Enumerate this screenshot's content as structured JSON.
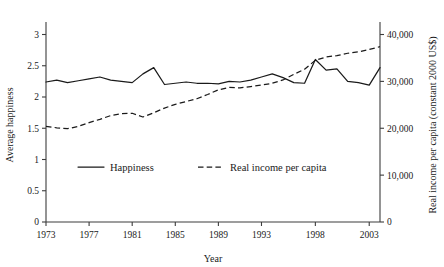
{
  "chart_data": {
    "type": "line",
    "title": "",
    "xlabel": "Year",
    "ylabel": "Average happiness",
    "y2label": "Real income per capita (constant 2000 US$)",
    "grid": false,
    "legend_position": "inside-bottom-center",
    "xlim": [
      1973,
      2004
    ],
    "ylim": [
      0,
      3.2
    ],
    "y2lim": [
      0,
      42667
    ],
    "xticks": [
      "1973",
      "1977",
      "1981",
      "1985",
      "1989",
      "1993",
      "1998",
      "2003"
    ],
    "xtick_values": [
      1973,
      1977,
      1981,
      1985,
      1989,
      1993,
      1998,
      2003
    ],
    "yticks": [
      "0",
      "0.5",
      "1",
      "1.5",
      "2",
      "2.5",
      "3"
    ],
    "ytick_values": [
      0,
      0.5,
      1,
      1.5,
      2,
      2.5,
      3
    ],
    "y2ticks": [
      "0",
      "10,000",
      "20,000",
      "30,000",
      "40,000"
    ],
    "y2tick_values": [
      0,
      10000,
      20000,
      30000,
      40000
    ],
    "x": [
      1973,
      1974,
      1975,
      1976,
      1977,
      1978,
      1979,
      1980,
      1981,
      1982,
      1983,
      1984,
      1985,
      1986,
      1987,
      1988,
      1989,
      1990,
      1991,
      1992,
      1993,
      1994,
      1995,
      1996,
      1997,
      1998,
      1999,
      2000,
      2001,
      2002,
      2003,
      2004
    ],
    "series": [
      {
        "name": "Happiness",
        "axis": "left",
        "style": "solid",
        "values": [
          2.24,
          2.27,
          2.23,
          2.26,
          2.29,
          2.32,
          2.27,
          2.25,
          2.23,
          2.37,
          2.47,
          2.2,
          2.22,
          2.24,
          2.22,
          2.22,
          2.21,
          2.25,
          2.24,
          2.27,
          2.32,
          2.37,
          2.31,
          2.23,
          2.22,
          2.6,
          2.43,
          2.45,
          2.25,
          2.23,
          2.19,
          2.47
        ]
      },
      {
        "name": "Real income per capita",
        "axis": "right",
        "style": "dashed",
        "values": [
          20400,
          20100,
          19900,
          20400,
          21200,
          21900,
          22700,
          23100,
          23200,
          22400,
          23300,
          24300,
          25100,
          25700,
          26300,
          27200,
          28200,
          28700,
          28600,
          28900,
          29200,
          29600,
          30300,
          31500,
          32600,
          34500,
          35200,
          35500,
          36000,
          36300,
          36800,
          37400
        ]
      }
    ]
  },
  "legend": {
    "items": [
      {
        "label": "Happiness",
        "style": "solid"
      },
      {
        "label": "Real income per capita",
        "style": "dashed"
      }
    ]
  }
}
